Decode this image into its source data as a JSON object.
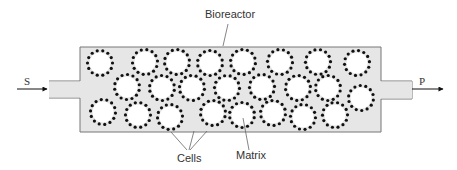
{
  "diagram": {
    "type": "packed-bed bioreactor schematic",
    "labels": {
      "bioreactor": "Bioreactor",
      "inlet": "S",
      "outlet": "P",
      "cells": "Cells",
      "matrix": "Matrix"
    },
    "colors": {
      "vessel_fill": "#e6e6e6",
      "vessel_stroke": "#777777",
      "sphere_fill": "#ffffff",
      "cell_dot": "#111111",
      "leader_line": "#666666"
    },
    "vessel": {
      "x": 80,
      "y": 47,
      "width": 301,
      "height": 85
    },
    "inlet_pipe": {
      "x1": 49,
      "x2": 80,
      "y1": 81,
      "y2": 98
    },
    "outlet_pipe": {
      "x1": 381,
      "x2": 412,
      "y1": 81,
      "y2": 99
    },
    "sphere_radius": 10.5,
    "spheres": [
      {
        "cx": 100,
        "cy": 63
      },
      {
        "cx": 145,
        "cy": 62
      },
      {
        "cx": 177,
        "cy": 62
      },
      {
        "cx": 210,
        "cy": 63
      },
      {
        "cx": 243,
        "cy": 62
      },
      {
        "cx": 280,
        "cy": 62
      },
      {
        "cx": 318,
        "cy": 62
      },
      {
        "cx": 357,
        "cy": 63
      },
      {
        "cx": 127,
        "cy": 87
      },
      {
        "cx": 162,
        "cy": 88
      },
      {
        "cx": 192,
        "cy": 88
      },
      {
        "cx": 227,
        "cy": 88
      },
      {
        "cx": 262,
        "cy": 87
      },
      {
        "cx": 298,
        "cy": 88
      },
      {
        "cx": 328,
        "cy": 88
      },
      {
        "cx": 361,
        "cy": 98
      },
      {
        "cx": 103,
        "cy": 112
      },
      {
        "cx": 138,
        "cy": 115
      },
      {
        "cx": 170,
        "cy": 117
      },
      {
        "cx": 213,
        "cy": 113
      },
      {
        "cx": 242,
        "cy": 115
      },
      {
        "cx": 273,
        "cy": 113
      },
      {
        "cx": 303,
        "cy": 117
      },
      {
        "cx": 335,
        "cy": 115
      }
    ]
  }
}
